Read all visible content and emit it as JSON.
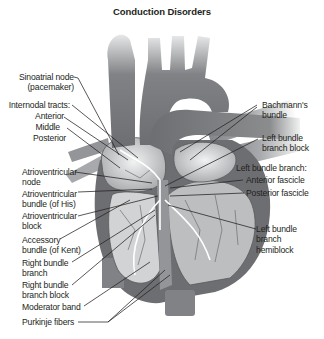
{
  "title": "Conduction Disorders",
  "colors": {
    "background": "#ffffff",
    "text": "#231f20",
    "heart_dark": "#6d6e71",
    "heart_mid": "#939598",
    "heart_light": "#d1d3d4",
    "leader_line": "#231f20"
  },
  "labels_left": {
    "sa_node": [
      "Sinoatrial node",
      "(pacemaker)"
    ],
    "internodal_heading": "Internodal tracts:",
    "internodal_anterior": "Anterior",
    "internodal_middle": "Middle",
    "internodal_posterior": "Posterior",
    "av_node": [
      "Atrioventricular",
      "node"
    ],
    "his_bundle": [
      "Atrioventricular",
      "bundle (of His)"
    ],
    "av_block": [
      "Atrioventricular",
      "block"
    ],
    "kent_bundle": [
      "Accessory",
      "bundle (of Kent)"
    ],
    "rbb": [
      "Right bundle",
      "branch"
    ],
    "rbb_block": [
      "Right bundle",
      "branch block"
    ],
    "moderator_band": "Moderator band",
    "purkinje": "Purkinje fibers"
  },
  "labels_right": {
    "bachmann": [
      "Bachmann's",
      "bundle"
    ],
    "lbb_block": [
      "Left bundle",
      "branch block"
    ],
    "lbb_heading": "Left bundle branch:",
    "anterior_fascicle": "Anterior fascicle",
    "posterior_fascicle": "Posterior fascicle",
    "lbb_hemiblock": [
      "Left bundle",
      "branch",
      "hemiblock"
    ]
  }
}
